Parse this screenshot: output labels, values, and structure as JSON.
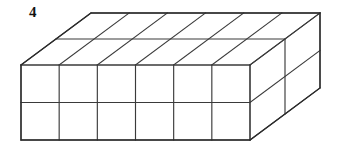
{
  "figure": {
    "label": "4",
    "label_name": "problem-number",
    "caption": "",
    "background_color": "#ffffff",
    "line_color": "#3a3a3a",
    "outline_color": "#2b2b2b",
    "face_color": "#ffffff"
  },
  "block": {
    "units_wide": 6,
    "units_deep": 2,
    "units_tall": 2,
    "total_cubes": 24,
    "front_face": {
      "columns": 6,
      "rows": 2,
      "left_x": 21,
      "right_x": 250,
      "top_y": 65,
      "bottom_y": 140,
      "cell_width": 38.17,
      "cell_height": 37.5
    },
    "top_face": {
      "columns": 6,
      "rows": 2
    },
    "right_face": {
      "columns": 2,
      "rows": 2
    },
    "depth_vector": {
      "dx": 35,
      "dy": -26
    },
    "corners": {
      "front_top_left": [
        21,
        65
      ],
      "front_top_right": [
        250,
        65
      ],
      "front_bottom_left": [
        21,
        140
      ],
      "front_bottom_right": [
        250,
        140
      ],
      "back_top_left": [
        91,
        13
      ],
      "back_top_right": [
        320,
        13
      ],
      "back_bottom_right": [
        320,
        88
      ]
    }
  }
}
